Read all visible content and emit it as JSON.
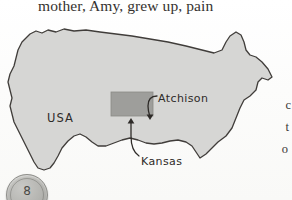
{
  "page": {
    "body_text_top": "mother, Amy, grew up, pain",
    "right_margin_lines": [
      "c",
      "t",
      "o"
    ],
    "page_number": "8"
  },
  "figure": {
    "type": "map",
    "labels": {
      "country": "USA",
      "city": "Atchison",
      "state": "Kansas"
    },
    "highlight": {
      "name": "Kansas",
      "shape": "rectangle",
      "fill": "#9e9e9b"
    },
    "colors": {
      "map_fill": "#d6d6d4",
      "map_outline": "#403d3a",
      "paper": "#fdfdfc",
      "text": "#35322f",
      "label_text": "#2e2b28"
    },
    "annotations": [
      {
        "label": "Atchison",
        "arrow": "curved-down-left"
      },
      {
        "label": "Kansas",
        "arrow": "curved-up"
      }
    ]
  }
}
